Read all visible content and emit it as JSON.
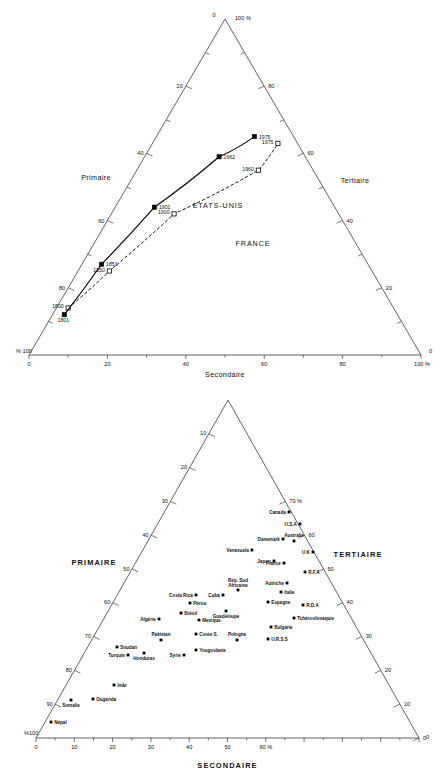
{
  "chart_data": [
    {
      "id": "top",
      "type": "scatter",
      "subtype": "ternary-trajectory",
      "title": "",
      "axes": {
        "left": {
          "label": "Primaire",
          "ticks": [
            20,
            40,
            60,
            80
          ],
          "minor_step": 10,
          "apex_label": "0",
          "base_label": "% 100"
        },
        "right": {
          "label": "Tertiaire",
          "ticks": [
            20,
            40,
            60,
            80
          ],
          "apex_label": "100 %",
          "base_label": "0"
        },
        "bottom": {
          "label": "Secondaire",
          "ticks": [
            0,
            20,
            40,
            60,
            80
          ],
          "left_label": "0",
          "right_label": "100 %",
          "left_corner": "% 100",
          "right_corner": "0"
        }
      },
      "legend_position": "inline-annotations",
      "grid": false,
      "series": [
        {
          "name": "ETATS-UNIS",
          "style": "dashed",
          "marker": "open-square",
          "points": [
            {
              "label": "1800",
              "primaire": 83,
              "secondaire": 14,
              "tertiaire": 3,
              "label_pos": "left"
            },
            {
              "label": "1850",
              "primaire": 67,
              "secondaire": 25,
              "tertiaire": 8,
              "label_pos": "left"
            },
            {
              "label": "1900",
              "primaire": 42,
              "secondaire": 42,
              "tertiaire": 16,
              "label_pos": "left"
            },
            {
              "label": "1960",
              "primaire": 14,
              "secondaire": 55,
              "tertiaire": 31,
              "label_pos": "left"
            },
            {
              "label": "1975",
              "primaire": 5,
              "secondaire": 63,
              "tertiaire": 32,
              "label_pos": "left"
            }
          ]
        },
        {
          "name": "FRANCE",
          "style": "solid",
          "marker": "filled-square",
          "points": [
            {
              "label": "1801",
              "primaire": 85,
              "secondaire": 12,
              "tertiaire": 3,
              "label_pos": "below"
            },
            {
              "label": "1851",
              "primaire": 68,
              "secondaire": 27,
              "tertiaire": 5,
              "label_pos": "right"
            },
            {
              "label": "1901",
              "primaire": 46,
              "secondaire": 44,
              "tertiaire": 10,
              "label_pos": "right"
            },
            {
              "label": "1962",
              "primaire": 22,
              "secondaire": 59,
              "tertiaire": 19,
              "label_pos": "right"
            },
            {
              "label": "1975",
              "primaire": 10,
              "secondaire": 65,
              "tertiaire": 25,
              "label_pos": "right"
            }
          ]
        }
      ]
    },
    {
      "id": "bottom",
      "type": "scatter",
      "subtype": "ternary-countries",
      "title": "",
      "axes": {
        "left": {
          "label": "PRIMAIRE",
          "ticks": [
            10,
            20,
            30,
            40,
            50,
            60,
            70,
            80,
            90
          ],
          "base_label": "%100"
        },
        "right": {
          "label": "TERTIAIRE",
          "ticks": [
            70,
            60,
            50,
            40,
            30,
            20,
            10,
            0
          ],
          "top_label": "70 %"
        },
        "bottom": {
          "label": "SECONDAIRE",
          "ticks": [
            0,
            10,
            20,
            30,
            40,
            50,
            60
          ],
          "last_tick_suffix": "60 %",
          "left_corner": "%100",
          "right_corner": "0"
        }
      },
      "grid": false,
      "legend_position": "none",
      "points": [
        {
          "name": "Canada",
          "x": 289,
          "y": 512,
          "label_pos": "left"
        },
        {
          "name": "U.S.A",
          "x": 300,
          "y": 524,
          "label_pos": "left"
        },
        {
          "name": "Danemark",
          "x": 283,
          "y": 539,
          "label_pos": "left"
        },
        {
          "name": "Australie",
          "x": 294,
          "y": 541,
          "label_pos": "above"
        },
        {
          "name": "Venezuela",
          "x": 252,
          "y": 550,
          "label_pos": "left"
        },
        {
          "name": "U.K",
          "x": 313,
          "y": 552,
          "label_pos": "left"
        },
        {
          "name": "Japon",
          "x": 274,
          "y": 561,
          "label_pos": "left"
        },
        {
          "name": "France",
          "x": 284,
          "y": 563,
          "label_pos": "left"
        },
        {
          "name": "R.F.A",
          "x": 305,
          "y": 572,
          "label_pos": "right"
        },
        {
          "name": "Autriche",
          "x": 287,
          "y": 583,
          "label_pos": "left"
        },
        {
          "name": "Italie",
          "x": 281,
          "y": 592,
          "label_pos": "right"
        },
        {
          "name": "Rép. Sud\nAfricaine",
          "x": 238,
          "y": 590,
          "label_pos": "above2"
        },
        {
          "name": "Costa Rica",
          "x": 196,
          "y": 595,
          "label_pos": "left"
        },
        {
          "name": "Cuba",
          "x": 223,
          "y": 595,
          "label_pos": "left"
        },
        {
          "name": "Espagne",
          "x": 268,
          "y": 602,
          "label_pos": "right"
        },
        {
          "name": "Pérou",
          "x": 190,
          "y": 603,
          "label_pos": "right"
        },
        {
          "name": "R.D.A",
          "x": 303,
          "y": 605,
          "label_pos": "right"
        },
        {
          "name": "Brésil",
          "x": 181,
          "y": 613,
          "label_pos": "right"
        },
        {
          "name": "Guadeloupe",
          "x": 226,
          "y": 611,
          "label_pos": "below"
        },
        {
          "name": "Mexique",
          "x": 199,
          "y": 620,
          "label_pos": "right"
        },
        {
          "name": "Algérie",
          "x": 159,
          "y": 619,
          "label_pos": "left"
        },
        {
          "name": "Tchécoslovaquie",
          "x": 294,
          "y": 618,
          "label_pos": "right"
        },
        {
          "name": "Bulgarie",
          "x": 271,
          "y": 627,
          "label_pos": "right"
        },
        {
          "name": "Corée S.",
          "x": 196,
          "y": 634,
          "label_pos": "right"
        },
        {
          "name": "Pologne",
          "x": 237,
          "y": 640,
          "label_pos": "above"
        },
        {
          "name": "Pakistan",
          "x": 161,
          "y": 640,
          "label_pos": "above"
        },
        {
          "name": "U.R.S.S",
          "x": 268,
          "y": 639,
          "label_pos": "right"
        },
        {
          "name": "Soudan",
          "x": 117,
          "y": 647,
          "label_pos": "right"
        },
        {
          "name": "Yougoslavie",
          "x": 196,
          "y": 650,
          "label_pos": "right"
        },
        {
          "name": "Syrie",
          "x": 184,
          "y": 655,
          "label_pos": "left"
        },
        {
          "name": "Turquie",
          "x": 128,
          "y": 655,
          "label_pos": "left"
        },
        {
          "name": "Honduras",
          "x": 144,
          "y": 653,
          "label_pos": "below"
        },
        {
          "name": "Inde",
          "x": 114,
          "y": 685,
          "label_pos": "right"
        },
        {
          "name": "Somalie",
          "x": 71,
          "y": 700,
          "label_pos": "below"
        },
        {
          "name": "Ouganda",
          "x": 93,
          "y": 699,
          "label_pos": "right"
        },
        {
          "name": "Népal",
          "x": 51,
          "y": 722,
          "label_pos": "right"
        }
      ]
    }
  ],
  "colors": {
    "ink": "#000000",
    "axis": "#3a3a3a",
    "background": "#ffffff"
  }
}
